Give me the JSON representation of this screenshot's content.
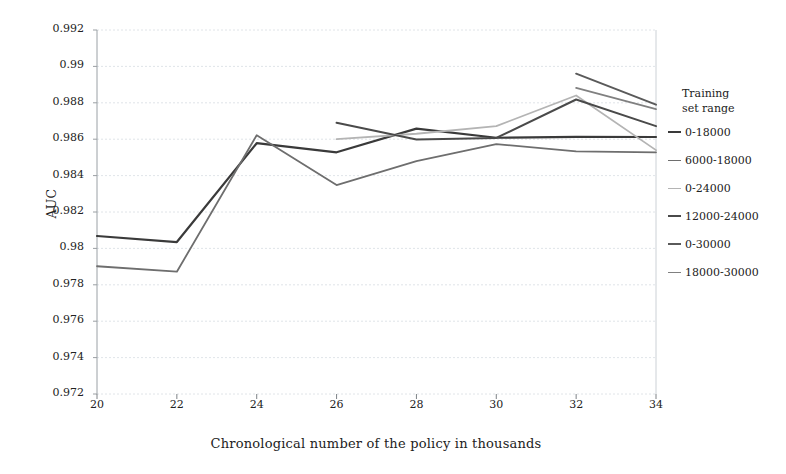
{
  "chart_data": {
    "type": "line",
    "title": "",
    "xlabel": "Chronological number of the policy in thousands",
    "ylabel": "AUC",
    "x": [
      20,
      22,
      24,
      26,
      28,
      30,
      32,
      34
    ],
    "xlim": [
      20,
      34
    ],
    "ylim": [
      0.972,
      0.992
    ],
    "xticks": [
      "20",
      "22",
      "24",
      "26",
      "28",
      "30",
      "32",
      "34"
    ],
    "yticks": [
      "0.992",
      "0.99",
      "0.988",
      "0.986",
      "0.984",
      "0.982",
      "0.98",
      "0.978",
      "0.976",
      "0.974",
      "0.972"
    ],
    "grid": true,
    "legend_position": "right",
    "legend_title": "Training\nset range",
    "series": [
      {
        "name": "0-18000",
        "color": "#3a3a3a",
        "width": 2.2,
        "x": [
          20,
          22,
          24,
          26,
          28,
          30,
          32,
          34
        ],
        "values": [
          0.98068,
          0.98035,
          0.98578,
          0.98528,
          0.98658,
          0.98608,
          0.98613,
          0.98612
        ]
      },
      {
        "name": "6000-18000",
        "color": "#6e6e6e",
        "width": 1.8,
        "x": [
          20,
          22,
          24,
          26,
          28,
          30,
          32,
          34
        ],
        "values": [
          0.97902,
          0.97872,
          0.98622,
          0.98348,
          0.9848,
          0.98573,
          0.98533,
          0.98528
        ]
      },
      {
        "name": "0-24000",
        "color": "#b4b4b4",
        "width": 1.8,
        "x": [
          26,
          28,
          30,
          32,
          34
        ],
        "values": [
          0.986,
          0.9863,
          0.98672,
          0.9884,
          0.9854
        ]
      },
      {
        "name": "12000-24000",
        "color": "#4a4a4a",
        "width": 2.0,
        "x": [
          26,
          28,
          30,
          32,
          34
        ],
        "values": [
          0.9869,
          0.98598,
          0.98607,
          0.98818,
          0.98672
        ]
      },
      {
        "name": "0-30000",
        "color": "#5a5a5a",
        "width": 2.0,
        "x": [
          32,
          34
        ],
        "values": [
          0.9896,
          0.9879
        ]
      },
      {
        "name": "18000-30000",
        "color": "#808080",
        "width": 1.8,
        "x": [
          32,
          34
        ],
        "values": [
          0.98882,
          0.98765
        ]
      }
    ]
  },
  "axes": {
    "y_title": "AUC",
    "x_title": "Chronological number of the policy in thousands"
  },
  "legend": {
    "title": "Training\nset range",
    "items": [
      {
        "label": "0-18000"
      },
      {
        "label": "6000-18000"
      },
      {
        "label": "0-24000"
      },
      {
        "label": "12000-24000"
      },
      {
        "label": "0-30000"
      },
      {
        "label": "18000-30000"
      }
    ]
  }
}
